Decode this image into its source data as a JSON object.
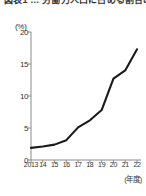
{
  "figure": {
    "title_partial": "図表1 … 労働力人口に占める割合の推移",
    "unit_label": "(%)",
    "x_caption": "(年度)"
  },
  "chart_data": {
    "type": "line",
    "title": "",
    "xlabel": "(年度)",
    "ylabel": "(%)",
    "categories": [
      "2013",
      "14",
      "15",
      "16",
      "17",
      "18",
      "19",
      "20",
      "21",
      "22"
    ],
    "x": [
      2013,
      2014,
      2015,
      2016,
      2017,
      2018,
      2019,
      2020,
      2021,
      2022
    ],
    "values": [
      1.9,
      2.1,
      2.4,
      3.1,
      5.1,
      6.2,
      7.8,
      12.7,
      14.0,
      17.3
    ],
    "ylim": [
      0,
      20
    ],
    "yticks": [
      0,
      5,
      10,
      15,
      20
    ],
    "ytick_labels": [
      "0",
      "5",
      "10",
      "15",
      "20"
    ],
    "xlim": [
      2013,
      2022
    ],
    "grid": false,
    "legend": null,
    "series_color": "#1a1a1a",
    "axis_color": "#8a8a8a"
  }
}
